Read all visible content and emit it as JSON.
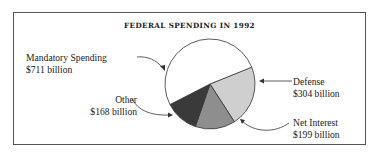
{
  "chart_data": {
    "type": "pie",
    "title": "FEDERAL SPENDING IN 1992",
    "unit": "billion USD",
    "categories": [
      "Mandatory Spending",
      "Defense",
      "Net Interest",
      "Other"
    ],
    "values": [
      711,
      304,
      199,
      168
    ],
    "value_labels": [
      "$711 billion",
      "$304 billion",
      "$199 billion",
      "$168 billion"
    ],
    "colors": [
      "#ffffff",
      "#cfcfcf",
      "#8e8e8e",
      "#3a3a3a"
    ],
    "legend": "none (callout labels with arrows)"
  },
  "labels": {
    "mandatory": {
      "name": "Mandatory Spending",
      "value": "$711 billion"
    },
    "defense": {
      "name": "Defense",
      "value": "$304 billion"
    },
    "interest": {
      "name": "Net Interest",
      "value": "$199 billion"
    },
    "other": {
      "name": "Other",
      "value": "$168 billion"
    }
  }
}
